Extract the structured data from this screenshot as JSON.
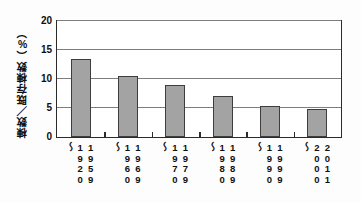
{
  "chart_data": {
    "type": "bar",
    "title": "",
    "subtitle": "",
    "xlabel": "",
    "ylabel": "棟数／既存棟数（%）",
    "categories": [
      "1920〜1959",
      "1960〜1969",
      "1970〜1979",
      "1980〜1989",
      "1990〜1999",
      "2000〜2011"
    ],
    "category_lines": [
      {
        "start": "1920",
        "sep": "〜",
        "end": "1959"
      },
      {
        "start": "1960",
        "sep": "〜",
        "end": "1969"
      },
      {
        "start": "1970",
        "sep": "〜",
        "end": "1979"
      },
      {
        "start": "1980",
        "sep": "〜",
        "end": "1989"
      },
      {
        "start": "1990",
        "sep": "〜",
        "end": "1999"
      },
      {
        "start": "2000",
        "sep": "〜",
        "end": "2011"
      }
    ],
    "values": [
      13.5,
      10.5,
      8.9,
      7.0,
      5.4,
      4.9
    ],
    "ylim": [
      0,
      20
    ],
    "yticks": [
      0,
      5,
      10,
      15,
      20
    ],
    "ytick_labels": [
      "0",
      "5",
      "10",
      "15",
      "20"
    ],
    "grid": true,
    "legend": false,
    "bar_color": "#a3a3a3",
    "bar_edge_color": "#3d3d3d",
    "axis_color": "#2b2b2b",
    "grid_color": "#7d7d7d",
    "plot_background": "#ffffff"
  }
}
